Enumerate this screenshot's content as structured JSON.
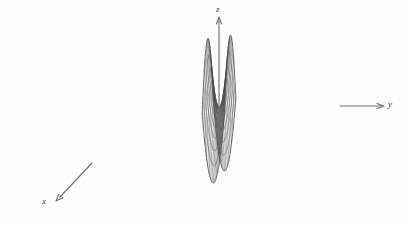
{
  "figure": {
    "title": "",
    "caption": "",
    "background_color": "#fdfdfd",
    "line_color": "#4a4a4a",
    "axis_color": "#6b6b6b"
  },
  "axes": [
    {
      "name": "z",
      "label": "z",
      "direction": "up",
      "label_x": 216,
      "label_y": 5,
      "arrow": true
    },
    {
      "name": "y",
      "label": "y",
      "direction": "right",
      "label_x": 388,
      "label_y": 100,
      "arrow": true
    },
    {
      "name": "x",
      "label": "x",
      "direction": "down-left",
      "label_x": 42,
      "label_y": 197,
      "arrow": true
    }
  ],
  "chart_data": {
    "type": "line",
    "subtype": "3d-wireframe-surface",
    "title": "",
    "xlabel": "x",
    "ylabel": "y",
    "zlabel": "z",
    "surface": "hyperbolic paraboloid (saddle)",
    "equation": "z = (y^2 - x^2)",
    "xlim": [
      -1,
      1
    ],
    "ylim": [
      -1,
      1
    ],
    "zlim": [
      -1,
      1
    ],
    "grid": true,
    "legend": null,
    "mesh": {
      "u_divisions": 16,
      "v_divisions": 16,
      "u_range": [
        -1,
        1
      ],
      "v_range": [
        -1,
        1
      ]
    },
    "projection": {
      "origin_x": 219,
      "origin_y": 107,
      "y_axis_vector": [
        11.2,
        -1.6
      ],
      "x_axis_vector": [
        -5.6,
        6.0
      ],
      "z_axis_scale": 70.0
    },
    "sampled_points": [
      {
        "u": -1,
        "v": -1,
        "z": 0
      },
      {
        "u": -1,
        "v": 0,
        "z": -1
      },
      {
        "u": -1,
        "v": 1,
        "z": 0
      },
      {
        "u": 0,
        "v": -1,
        "z": 1
      },
      {
        "u": 0,
        "v": 0,
        "z": 0
      },
      {
        "u": 0,
        "v": 1,
        "z": 1
      },
      {
        "u": 1,
        "v": -1,
        "z": 0
      },
      {
        "u": 1,
        "v": 0,
        "z": -1
      },
      {
        "u": 1,
        "v": 1,
        "z": 0
      }
    ]
  }
}
